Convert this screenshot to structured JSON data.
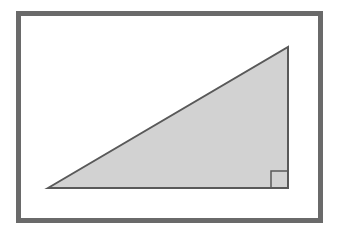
{
  "figure": {
    "canvas": {
      "width": 340,
      "height": 233,
      "background": "#ffffff"
    },
    "frame": {
      "name": "outer-border-frame",
      "x": 18.5,
      "y": 13.5,
      "width": 302,
      "height": 207,
      "stroke": "#6a6a6a",
      "stroke_width": 5,
      "fill": "none"
    },
    "triangle": {
      "name": "right-triangle",
      "points": "48,188 288,47 288,188",
      "vertices": [
        {
          "label": "left-acute-vertex",
          "x": 48,
          "y": 188
        },
        {
          "label": "top-apex-vertex",
          "x": 288,
          "y": 47
        },
        {
          "label": "right-angle-vertex",
          "x": 288,
          "y": 188
        }
      ],
      "fill": "#d2d2d2",
      "stroke": "#595959",
      "stroke_width": 2
    },
    "right_angle_marker": {
      "name": "right-angle-square-marker",
      "x": 271,
      "y": 171,
      "size": 17,
      "stroke": "#595959",
      "stroke_width": 1.5,
      "fill": "none"
    }
  }
}
